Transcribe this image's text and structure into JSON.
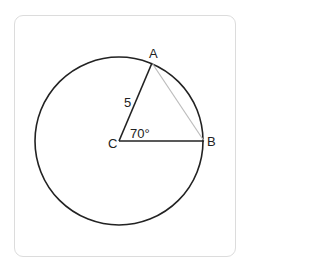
{
  "diagram": {
    "type": "circle-geometry",
    "circle": {
      "center_label": "C",
      "cx": 119,
      "cy": 141,
      "r": 84
    },
    "points": [
      {
        "label": "A",
        "x": 152,
        "y": 63
      },
      {
        "label": "B",
        "x": 204,
        "y": 141
      },
      {
        "label": "C",
        "x": 119,
        "y": 141
      }
    ],
    "segments": [
      {
        "from": "C",
        "to": "A",
        "label": "5",
        "color": "#222222"
      },
      {
        "from": "C",
        "to": "B",
        "label": "",
        "color": "#222222"
      },
      {
        "from": "A",
        "to": "B",
        "label": "",
        "color": "#bbbbbb"
      }
    ],
    "angle": {
      "vertex": "C",
      "label": "70°"
    },
    "labels": {
      "A": "A",
      "B": "B",
      "C": "C",
      "side_CA": "5",
      "angle_ACB": "70°"
    }
  }
}
